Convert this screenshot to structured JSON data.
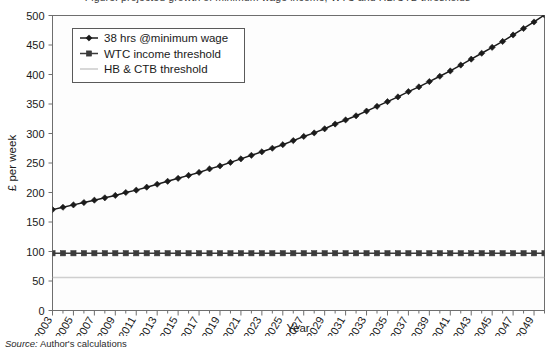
{
  "figure": {
    "title_partial": "Figure: projected growth of minimum wage income, WTC and HB/CTB thresholds",
    "source_label": "Source:",
    "source_text": "Author's calculations"
  },
  "axes": {
    "ylabel": "£ per week",
    "xlabel": "Year",
    "ylim": [
      0,
      500
    ],
    "ytick_step": 50,
    "yticks": [
      "0",
      "50",
      "100",
      "150",
      "200",
      "250",
      "300",
      "350",
      "400",
      "450",
      "500"
    ],
    "xticks": [
      "2003",
      "2005",
      "2007",
      "2009",
      "2011",
      "2013",
      "2015",
      "2017",
      "2019",
      "2021",
      "2023",
      "2025",
      "2027",
      "2029",
      "2031",
      "2033",
      "2035",
      "2037",
      "2039",
      "2041",
      "2043",
      "2045",
      "2047",
      "2049"
    ],
    "xlim": [
      2003,
      2050
    ],
    "grid": false
  },
  "legend": {
    "position": "top-left",
    "items": [
      {
        "label": "38 hrs @minimum wage",
        "marker": "diamond",
        "color": "#1b1b1b"
      },
      {
        "label": "WTC income threshold",
        "marker": "square",
        "color": "#3b3b3b"
      },
      {
        "label": "HB & CTB threshold",
        "marker": "line",
        "color": "#cfcfcf"
      }
    ]
  },
  "chart_data": {
    "type": "line",
    "title": "",
    "xlabel": "Year",
    "ylabel": "£ per week",
    "ylim": [
      0,
      500
    ],
    "xlim": [
      2003,
      2050
    ],
    "x": [
      2003,
      2004,
      2005,
      2006,
      2007,
      2008,
      2009,
      2010,
      2011,
      2012,
      2013,
      2014,
      2015,
      2016,
      2017,
      2018,
      2019,
      2020,
      2021,
      2022,
      2023,
      2024,
      2025,
      2026,
      2027,
      2028,
      2029,
      2030,
      2031,
      2032,
      2033,
      2034,
      2035,
      2036,
      2037,
      2038,
      2039,
      2040,
      2041,
      2042,
      2043,
      2044,
      2045,
      2046,
      2047,
      2048,
      2049,
      2050
    ],
    "series": [
      {
        "name": "38 hrs @minimum wage",
        "color": "#1b1b1b",
        "marker": "diamond",
        "values": [
          171,
          175,
          179,
          183,
          187,
          191,
          195,
          200,
          204,
          209,
          214,
          219,
          224,
          229,
          234,
          240,
          245,
          251,
          257,
          263,
          269,
          275,
          281,
          288,
          295,
          301,
          308,
          316,
          323,
          330,
          338,
          346,
          354,
          362,
          371,
          379,
          388,
          397,
          406,
          416,
          426,
          436,
          446,
          456,
          467,
          478,
          489,
          501
        ]
      },
      {
        "name": "WTC income threshold",
        "color": "#3b3b3b",
        "marker": "square",
        "values": [
          97,
          97,
          97,
          97,
          97,
          97,
          97,
          97,
          97,
          97,
          97,
          97,
          97,
          97,
          97,
          97,
          97,
          97,
          97,
          97,
          97,
          97,
          97,
          97,
          97,
          97,
          97,
          97,
          97,
          97,
          97,
          97,
          97,
          97,
          97,
          97,
          97,
          97,
          97,
          97,
          97,
          97,
          97,
          97,
          97,
          97,
          97,
          97
        ]
      },
      {
        "name": "HB & CTB threshold",
        "color": "#cfcfcf",
        "marker": "none",
        "values": [
          56,
          56,
          56,
          56,
          56,
          56,
          56,
          56,
          56,
          56,
          56,
          56,
          56,
          56,
          56,
          56,
          56,
          56,
          56,
          56,
          56,
          56,
          56,
          56,
          56,
          56,
          56,
          56,
          56,
          56,
          56,
          56,
          56,
          56,
          56,
          56,
          56,
          56,
          56,
          56,
          56,
          56,
          56,
          56,
          56,
          56,
          56,
          56
        ]
      }
    ]
  }
}
